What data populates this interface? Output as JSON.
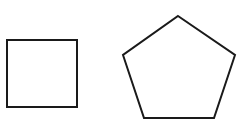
{
  "diagram": {
    "background": "#ffffff",
    "stroke_color": "#1a1a1a",
    "shapes": [
      {
        "type": "square",
        "label": "",
        "points": "7,40 77,40 77,107 7,107"
      },
      {
        "type": "pentagon",
        "label": "",
        "points": "178,16 235,55 214,118 144,118 123,55"
      }
    ]
  }
}
